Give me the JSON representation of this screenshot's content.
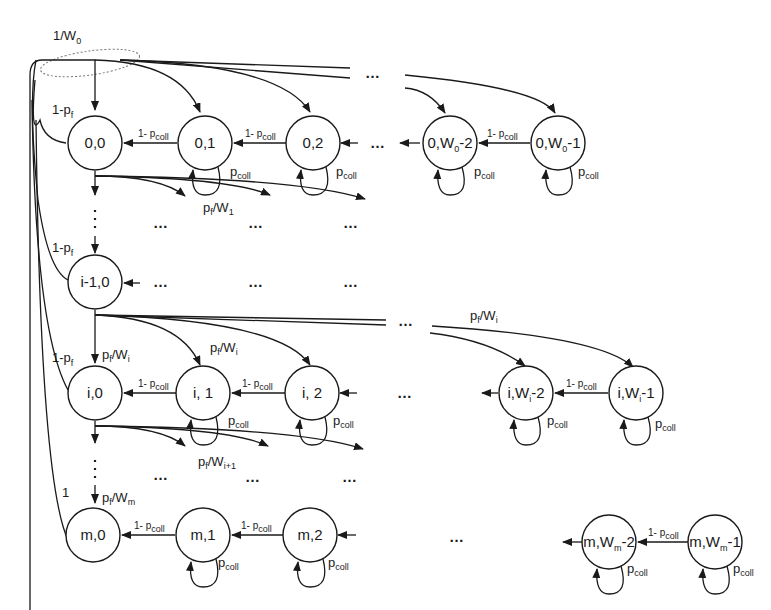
{
  "diagram": {
    "initial_label": {
      "main": "1/W",
      "sub": "0"
    },
    "rows": [
      {
        "id": "stage-0",
        "states": [
          {
            "main": "0,0",
            "sub": ""
          },
          {
            "main": "0,1",
            "sub": ""
          },
          {
            "main": "0,2",
            "sub": ""
          },
          {
            "main": "0,W",
            "sub": "0",
            "tail": "-2"
          },
          {
            "main": "0,W",
            "sub": "0",
            "tail": "-1"
          }
        ],
        "reset_label": {
          "main": "1-p",
          "sub": "f"
        },
        "down_label": {
          "main": "p",
          "sub": "f",
          "mid": "/W",
          "sub2": "1"
        }
      },
      {
        "id": "stage-i-1",
        "states": [
          {
            "main": "i-1,0",
            "sub": ""
          }
        ],
        "reset_label": {
          "main": "1-p",
          "sub": "f"
        }
      },
      {
        "id": "stage-i",
        "states": [
          {
            "main": "i,0",
            "sub": ""
          },
          {
            "main": "i, 1",
            "sub": ""
          },
          {
            "main": "i, 2",
            "sub": ""
          },
          {
            "main": "i,W",
            "sub": "i",
            "tail": "-2"
          },
          {
            "main": "i,W",
            "sub": "i",
            "tail": "-1"
          }
        ],
        "reset_label": {
          "main": "1-p",
          "sub": "f"
        },
        "entry_label": {
          "main": "p",
          "sub": "f",
          "mid": "/W",
          "sub2": "i"
        },
        "down_label": {
          "main": "p",
          "sub": "f",
          "mid": "/W",
          "sub2": "i+1"
        }
      },
      {
        "id": "stage-m",
        "states": [
          {
            "main": "m,0",
            "sub": ""
          },
          {
            "main": "m,1",
            "sub": ""
          },
          {
            "main": "m,2",
            "sub": ""
          },
          {
            "main": "m,W",
            "sub": "m",
            "tail": "-2"
          },
          {
            "main": "m,W",
            "sub": "m",
            "tail": "-1"
          }
        ],
        "reset_label": {
          "main": "1",
          "sub": ""
        },
        "entry_label": {
          "main": "p",
          "sub": "f",
          "mid": "/W",
          "sub2": "m"
        }
      }
    ],
    "transition_labels": {
      "decrement": {
        "main": "1- p",
        "sub": "coll"
      },
      "self_loop": {
        "main": "p",
        "sub": "coll"
      }
    },
    "ellipsis": "…",
    "vertical_ellipsis": "⋮"
  }
}
